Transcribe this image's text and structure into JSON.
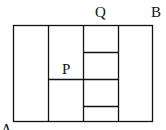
{
  "diagram": {
    "labels": {
      "A": "A",
      "B": "B",
      "P": "P",
      "Q": "Q"
    },
    "grid": {
      "outer": {
        "x1": 13.5,
        "y1": 25.5,
        "x2": 152.5,
        "y2": 121.5
      },
      "vertical_lines_x": [
        48.5,
        83.5,
        118.5
      ],
      "column3_horizontal_y": [
        52.5,
        79.5,
        106.5
      ],
      "column2_horizontal_y": [
        79.5
      ]
    },
    "line_color": "#111111"
  }
}
